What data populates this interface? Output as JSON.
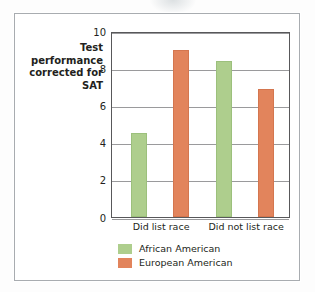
{
  "figure": {
    "background_color": "#ffffff",
    "frame_color": "#a8acb0"
  },
  "chart_data": {
    "type": "bar",
    "title": "",
    "xlabel": "",
    "ylabel": "Test performance corrected for SAT",
    "ylabel_lines": [
      "Test",
      "performance",
      "corrected for",
      "SAT"
    ],
    "categories": [
      "Did list race",
      "Did not list race"
    ],
    "series": [
      {
        "name": "African American",
        "color": "#aece8d",
        "values": [
          4.5,
          8.4
        ]
      },
      {
        "name": "European American",
        "color": "#e2845c",
        "values": [
          9.0,
          6.9
        ]
      }
    ],
    "ylim": [
      0,
      10
    ],
    "yticks": [
      0,
      2,
      4,
      6,
      8,
      10
    ],
    "ytick_labels": [
      "0",
      "2",
      "4",
      "6",
      "8",
      "10"
    ],
    "grid": "horizontal",
    "legend_position": "bottom-left"
  },
  "axis": {
    "ticks": [
      {
        "label": "10",
        "value": 10
      },
      {
        "label": "8",
        "value": 8
      },
      {
        "label": "6",
        "value": 6
      },
      {
        "label": "4",
        "value": 4
      },
      {
        "label": "2",
        "value": 2
      },
      {
        "label": "0",
        "value": 0
      }
    ]
  },
  "groups": [
    {
      "label": "Did list race"
    },
    {
      "label": "Did not list race"
    }
  ],
  "legend": {
    "items": [
      {
        "label": "African American",
        "color": "#aece8d"
      },
      {
        "label": "European American",
        "color": "#e2845c"
      }
    ]
  }
}
